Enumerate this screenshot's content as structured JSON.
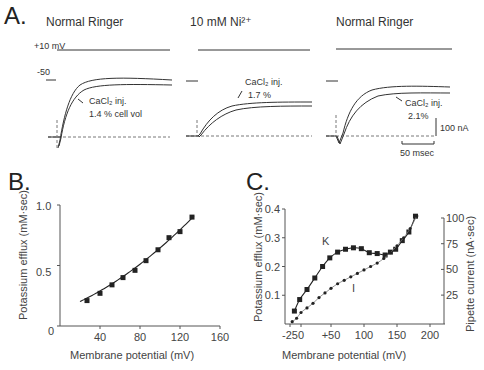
{
  "panel_a": {
    "letter": "A.",
    "conditions": [
      {
        "title": "Normal Ringer",
        "annotation_line1": "CaCl₂ inj.",
        "annotation_line2": "1.4 % cell vol"
      },
      {
        "title": "10 mM Ni²⁺",
        "annotation_line1": "CaCl₂ inj.",
        "annotation_line2": "1.7 %"
      },
      {
        "title": "Normal Ringer",
        "annotation_line1": "CaCl₂ inj.",
        "annotation_line2": "2.1%"
      }
    ],
    "voltage_high_label": "+10 mV",
    "voltage_low_label": "-50",
    "scale_current": "100 nA",
    "scale_time": "50 msec"
  },
  "panel_b": {
    "letter": "B."
  },
  "panel_c": {
    "letter": "C.",
    "label_k": "K",
    "label_i": "I"
  },
  "chart_data": [
    {
      "id": "B",
      "type": "scatter",
      "title": "",
      "xlabel": "Membrane potential (mV)",
      "ylabel": "Potassium efflux (mM·sec)",
      "xlim": [
        0,
        160
      ],
      "ylim": [
        0,
        1.0
      ],
      "xticks": [
        40,
        80,
        120,
        160
      ],
      "yticks": [
        0,
        0.5,
        1.0
      ],
      "ytick_labels": [
        "0",
        "0.5",
        "1.0"
      ],
      "grid": false,
      "series": [
        {
          "name": "K efflux",
          "marker": "square",
          "fit_line": true,
          "x": [
            27,
            40,
            52,
            63,
            75,
            86,
            98,
            109,
            120,
            132
          ],
          "y": [
            0.21,
            0.27,
            0.34,
            0.4,
            0.46,
            0.54,
            0.63,
            0.73,
            0.78,
            0.9
          ]
        }
      ]
    },
    {
      "id": "C",
      "type": "scatter",
      "title": "",
      "xlabel": "Membrane potential (mV)",
      "ylabel": "Potassium efflux (mM·sec)",
      "ylabel_right": "Pipette current (nA·sec)",
      "xticks": [
        -25,
        0,
        50,
        100,
        150,
        200
      ],
      "xtick_labels": [
        "-25",
        "0",
        "+50",
        "100",
        "150",
        "200"
      ],
      "yticks": [
        0.1,
        0.2,
        0.3,
        0.4
      ],
      "ytick_labels": [
        "0.1",
        "0.2",
        "0.3",
        "0.4"
      ],
      "yticks_right": [
        25,
        50,
        75,
        100
      ],
      "ylim": [
        0,
        0.4
      ],
      "ylim_right": [
        0,
        100
      ],
      "grid": false,
      "series": [
        {
          "name": "K",
          "marker": "square",
          "axis": "left",
          "x": [
            -15,
            -3,
            10,
            23,
            36,
            48,
            60,
            72,
            84,
            96,
            108,
            120,
            132,
            140,
            148,
            158,
            168,
            178
          ],
          "y": [
            0.045,
            0.085,
            0.12,
            0.16,
            0.2,
            0.23,
            0.25,
            0.26,
            0.265,
            0.262,
            0.248,
            0.245,
            0.24,
            0.25,
            0.26,
            0.29,
            0.32,
            0.375
          ]
        },
        {
          "name": "I",
          "marker": "dot",
          "axis": "right",
          "x": [
            -20,
            -10,
            0,
            10,
            20,
            30,
            40,
            50,
            60,
            70,
            80,
            90,
            100,
            110,
            120,
            130,
            140,
            150,
            160,
            170,
            180
          ],
          "y": [
            2,
            5,
            10,
            14,
            18,
            23,
            27,
            31,
            35,
            38,
            41,
            44,
            47,
            50,
            53,
            57,
            62,
            68,
            75,
            83,
            94
          ]
        }
      ]
    }
  ]
}
